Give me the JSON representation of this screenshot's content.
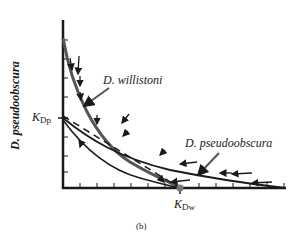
{
  "figure": {
    "caption": "(b)",
    "y_axis_label": "D. pseudoobscura",
    "x_axis_label": "",
    "species_labels": {
      "willistoni": "D. willistoni",
      "pseudoobscura": "D. pseudoobscura"
    },
    "equilibrium_labels": {
      "k_dp_main": "K",
      "k_dp_sub": "Dp",
      "k_dw_main": "K",
      "k_dw_sub": "Dw"
    },
    "colors": {
      "line": "#1a1a1a",
      "isocline_willistoni": "#555555",
      "equilibrium_point": "#777777"
    }
  }
}
